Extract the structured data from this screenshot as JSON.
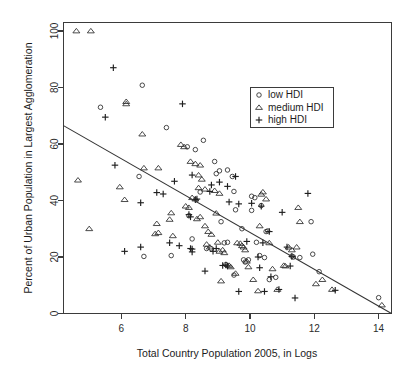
{
  "chart_data": {
    "type": "scatter",
    "title": "",
    "xlabel": "Total Country Population 2005, in Logs",
    "ylabel": "Percent of Urban Population in Largest Agglomeration",
    "xlim": [
      4.2,
      14.4
    ],
    "ylim": [
      0,
      103
    ],
    "xticks": [
      6,
      8,
      10,
      12,
      14
    ],
    "yticks": [
      0,
      20,
      40,
      60,
      80,
      100
    ],
    "xtick_labels": [
      "6",
      "8",
      "10",
      "12",
      "14"
    ],
    "ytick_labels": [
      "0",
      "20",
      "40",
      "60",
      "80",
      "100"
    ],
    "grid": false,
    "legend_position": "upper-right",
    "marker_color": "#2a2a2a",
    "line_color": "#333333",
    "frame_color": "#3b3b3b",
    "background": "#ffffff",
    "fit_line": {
      "label": "linear fit",
      "x0": 4.2,
      "y0": 66.5,
      "x1": 14.4,
      "y1": 0.0
    },
    "series": [
      {
        "name": "low HDI",
        "marker": "circle",
        "legend_label": "low HDI",
        "points": [
          [
            5.35,
            73.0
          ],
          [
            6.65,
            80.8
          ],
          [
            6.55,
            48.5
          ],
          [
            6.7,
            20.2
          ],
          [
            7.4,
            65.8
          ],
          [
            7.55,
            20.5
          ],
          [
            8.05,
            59.0
          ],
          [
            8.3,
            58.0
          ],
          [
            8.55,
            61.3
          ],
          [
            8.2,
            26.4
          ],
          [
            8.45,
            43.0
          ],
          [
            8.9,
            53.8
          ],
          [
            8.95,
            49.5
          ],
          [
            9.05,
            50.5
          ],
          [
            9.3,
            50.8
          ],
          [
            9.45,
            48.5
          ],
          [
            9.5,
            43.2
          ],
          [
            9.55,
            36.7
          ],
          [
            9.1,
            32.5
          ],
          [
            9.2,
            25.0
          ],
          [
            9.3,
            25.2
          ],
          [
            9.25,
            17.3
          ],
          [
            9.5,
            13.6
          ],
          [
            9.75,
            30.0
          ],
          [
            9.8,
            19.0
          ],
          [
            9.85,
            18.2
          ],
          [
            10.05,
            41.5
          ],
          [
            10.15,
            41.0
          ],
          [
            10.2,
            25.2
          ],
          [
            10.3,
            20.5
          ],
          [
            10.35,
            38.2
          ],
          [
            10.45,
            19.8
          ],
          [
            10.5,
            29.0
          ],
          [
            10.55,
            29.2
          ],
          [
            10.6,
            12.0
          ],
          [
            10.8,
            12.8
          ],
          [
            10.05,
            36.5
          ],
          [
            11.3,
            20.3
          ],
          [
            11.35,
            20.0
          ],
          [
            11.55,
            19.8
          ],
          [
            11.9,
            32.5
          ],
          [
            11.95,
            21.0
          ],
          [
            12.15,
            14.8
          ],
          [
            14.0,
            5.6
          ],
          [
            8.1,
            34.6
          ],
          [
            8.65,
            23.0
          ],
          [
            8.8,
            22.9
          ],
          [
            9.95,
            19.0
          ]
        ]
      },
      {
        "name": "medium HDI",
        "marker": "triangle",
        "legend_label": "medium HDI",
        "points": [
          [
            4.6,
            100.0
          ],
          [
            5.05,
            100.0
          ],
          [
            6.15,
            75.0
          ],
          [
            6.15,
            74.2
          ],
          [
            6.65,
            63.5
          ],
          [
            4.65,
            47.2
          ],
          [
            5.0,
            30.0
          ],
          [
            5.95,
            44.8
          ],
          [
            6.1,
            40.3
          ],
          [
            6.7,
            51.5
          ],
          [
            7.15,
            51.5
          ],
          [
            7.1,
            31.8
          ],
          [
            7.15,
            28.6
          ],
          [
            7.05,
            28.2
          ],
          [
            7.55,
            35.6
          ],
          [
            7.5,
            33.3
          ],
          [
            7.6,
            27.5
          ],
          [
            7.85,
            59.8
          ],
          [
            7.95,
            59.0
          ],
          [
            8.15,
            53.8
          ],
          [
            8.3,
            53.0
          ],
          [
            8.45,
            52.5
          ],
          [
            8.4,
            49.0
          ],
          [
            8.5,
            47.5
          ],
          [
            8.6,
            44.0
          ],
          [
            8.4,
            44.5
          ],
          [
            8.2,
            41.0
          ],
          [
            8.3,
            40.5
          ],
          [
            8.0,
            38.0
          ],
          [
            8.1,
            37.5
          ],
          [
            8.45,
            34.2
          ],
          [
            8.35,
            33.5
          ],
          [
            8.6,
            31.0
          ],
          [
            8.7,
            29.0
          ],
          [
            8.8,
            28.0
          ],
          [
            8.65,
            24.5
          ],
          [
            8.75,
            23.5
          ],
          [
            9.0,
            25.2
          ],
          [
            9.05,
            22.0
          ],
          [
            9.15,
            22.5
          ],
          [
            9.2,
            21.5
          ],
          [
            9.1,
            11.5
          ],
          [
            9.35,
            17.0
          ],
          [
            9.4,
            16.5
          ],
          [
            9.55,
            14.2
          ],
          [
            9.7,
            24.8
          ],
          [
            9.75,
            24.0
          ],
          [
            9.8,
            23.5
          ],
          [
            9.85,
            22.5
          ],
          [
            9.9,
            18.5
          ],
          [
            9.95,
            16.5
          ],
          [
            10.1,
            12.0
          ],
          [
            10.25,
            8.0
          ],
          [
            10.3,
            31.0
          ],
          [
            10.4,
            43.0
          ],
          [
            10.35,
            42.2
          ],
          [
            10.5,
            40.5
          ],
          [
            10.6,
            25.0
          ],
          [
            10.85,
            8.5
          ],
          [
            11.05,
            17.0
          ],
          [
            11.1,
            16.8
          ],
          [
            11.2,
            23.5
          ],
          [
            11.3,
            22.5
          ],
          [
            11.45,
            23.5
          ],
          [
            11.5,
            37.5
          ],
          [
            11.55,
            32.5
          ],
          [
            12.05,
            10.5
          ],
          [
            12.25,
            12.0
          ],
          [
            12.55,
            8.5
          ],
          [
            14.1,
            3.0
          ],
          [
            8.9,
            43.5
          ],
          [
            9.05,
            42.5
          ],
          [
            8.95,
            35.5
          ],
          [
            9.6,
            25.0
          ],
          [
            10.7,
            15.8
          ]
        ]
      },
      {
        "name": "high HDI",
        "marker": "plus",
        "legend_label": "high HDI",
        "points": [
          [
            5.75,
            87.0
          ],
          [
            5.5,
            69.5
          ],
          [
            7.9,
            74.2
          ],
          [
            5.8,
            52.5
          ],
          [
            7.1,
            42.8
          ],
          [
            7.3,
            42.3
          ],
          [
            7.65,
            46.8
          ],
          [
            8.2,
            49.0
          ],
          [
            6.6,
            39.2
          ],
          [
            6.1,
            22.0
          ],
          [
            6.6,
            23.5
          ],
          [
            7.5,
            25.0
          ],
          [
            7.8,
            24.0
          ],
          [
            8.15,
            23.0
          ],
          [
            8.2,
            22.8
          ],
          [
            8.2,
            21.8
          ],
          [
            8.35,
            40.5
          ],
          [
            8.3,
            40.3
          ],
          [
            8.1,
            35.0
          ],
          [
            8.15,
            34.2
          ],
          [
            8.75,
            43.2
          ],
          [
            8.8,
            45.5
          ],
          [
            9.05,
            46.5
          ],
          [
            9.3,
            45.0
          ],
          [
            9.35,
            39.5
          ],
          [
            9.55,
            48.5
          ],
          [
            9.65,
            38.8
          ],
          [
            8.6,
            15.0
          ],
          [
            8.95,
            23.0
          ],
          [
            9.15,
            17.0
          ],
          [
            9.25,
            17.2
          ],
          [
            9.3,
            16.8
          ],
          [
            8.85,
            22.0
          ],
          [
            9.65,
            7.8
          ],
          [
            10.3,
            16.2
          ],
          [
            10.45,
            7.8
          ],
          [
            10.65,
            13.0
          ],
          [
            10.9,
            8.5
          ],
          [
            10.6,
            29.0
          ],
          [
            10.4,
            25.0
          ],
          [
            10.25,
            20.0
          ],
          [
            10.35,
            38.0
          ],
          [
            11.0,
            35.8
          ],
          [
            11.15,
            23.5
          ],
          [
            11.3,
            20.2
          ],
          [
            11.25,
            16.8
          ],
          [
            11.4,
            5.5
          ],
          [
            11.8,
            42.5
          ],
          [
            12.65,
            8.2
          ],
          [
            10.05,
            39.0
          ],
          [
            9.9,
            25.5
          ]
        ]
      }
    ]
  },
  "legend": {
    "entries": [
      {
        "label": "low HDI",
        "marker": "circle"
      },
      {
        "label": "medium HDI",
        "marker": "triangle"
      },
      {
        "label": "high HDI",
        "marker": "plus"
      }
    ]
  }
}
